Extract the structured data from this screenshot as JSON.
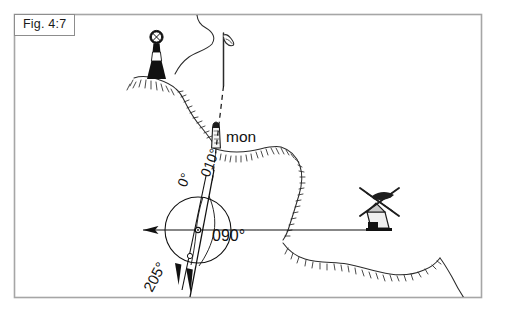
{
  "figure": {
    "label": "Fig. 4:7",
    "caption_box_border_color": "#8d8d8d",
    "frame_border_color": "#a6a6a6",
    "background_color": "#ffffff",
    "ink_color": "#111111"
  },
  "map": {
    "type": "nautical-chart-bearing-fix",
    "place_labels": [
      {
        "id": "monument",
        "text": "mon",
        "x": 221,
        "y": 137
      }
    ],
    "symbols": [
      {
        "id": "lighthouse",
        "name": "lighthouse-symbol",
        "x": 156,
        "y": 55
      },
      {
        "id": "flagstaff",
        "name": "flagstaff-symbol",
        "x": 225,
        "y": 55
      },
      {
        "id": "monument",
        "name": "monument-symbol",
        "x": 216,
        "y": 136
      },
      {
        "id": "windmill",
        "name": "windmill-symbol",
        "x": 382,
        "y": 208
      }
    ]
  },
  "compass": {
    "center_x": 198,
    "center_y": 230,
    "radius": 33,
    "bearings": [
      {
        "id": "north",
        "label": "0°",
        "value": 0,
        "label_x": 186,
        "label_y": 183,
        "rotation": -68
      },
      {
        "id": "transit",
        "label": "010°",
        "value": 10,
        "label_x": 209,
        "label_y": 180,
        "rotation": -68
      },
      {
        "id": "east",
        "label": "090°",
        "value": 90,
        "label_x": 212,
        "label_y": 239,
        "rotation": 0
      },
      {
        "id": "southwest",
        "label": "205°",
        "value": 205,
        "label_x": 156,
        "label_y": 262,
        "rotation": -62
      }
    ]
  }
}
